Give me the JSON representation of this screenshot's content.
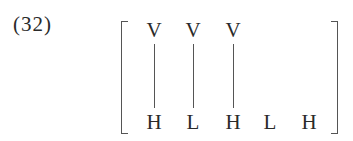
{
  "example_number": "(32)",
  "tiers": {
    "top": [
      {
        "symbol": "V",
        "x": 144
      },
      {
        "symbol": "V",
        "x": 183
      },
      {
        "symbol": "V",
        "x": 223
      }
    ],
    "bottom": [
      {
        "symbol": "H",
        "x": 144
      },
      {
        "symbol": "L",
        "x": 183
      },
      {
        "symbol": "H",
        "x": 223
      },
      {
        "symbol": "L",
        "x": 260
      },
      {
        "symbol": "H",
        "x": 299
      }
    ]
  },
  "associations": [
    {
      "from": 0,
      "to": 0
    },
    {
      "from": 1,
      "to": 1
    },
    {
      "from": 2,
      "to": 2
    }
  ]
}
